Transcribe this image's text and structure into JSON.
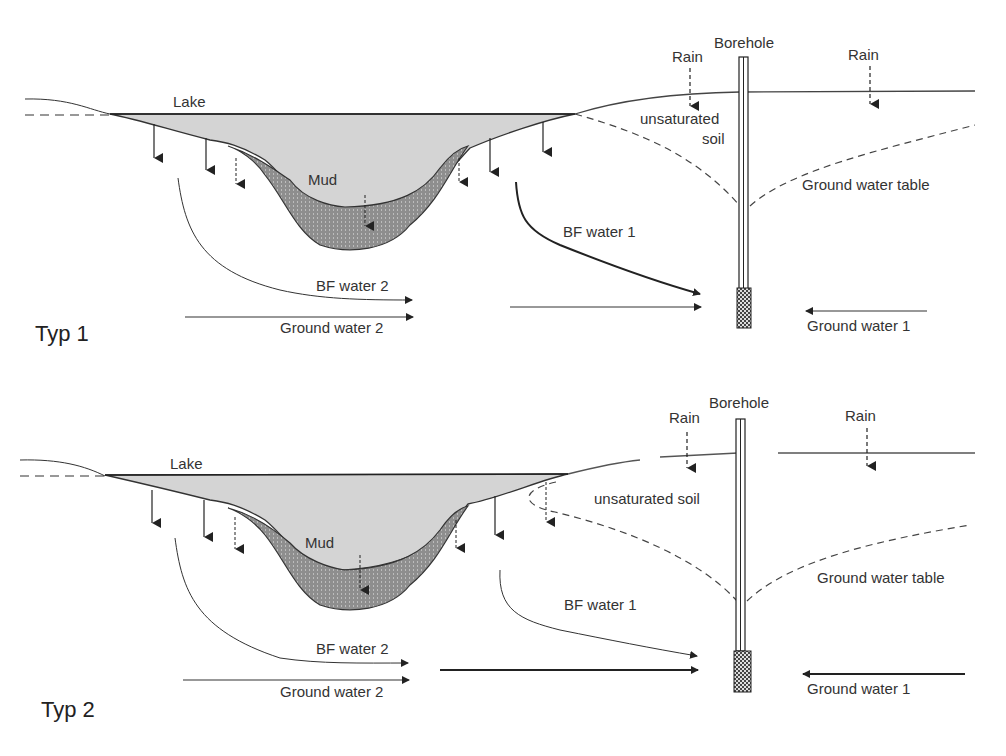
{
  "panels": [
    {
      "title": "Typ 1",
      "labels": {
        "lake": "Lake",
        "mud": "Mud",
        "borehole": "Borehole",
        "rain_left": "Rain",
        "rain_right": "Rain",
        "unsaturated_line1": "unsaturated",
        "unsaturated_line2": "soil",
        "ground_water_table": "Ground water table",
        "bf_water_1": "BF water 1",
        "bf_water_2": "BF water 2",
        "ground_water_1": "Ground water 1",
        "ground_water_2": "Ground water 2"
      }
    },
    {
      "title": "Typ 2",
      "labels": {
        "lake": "Lake",
        "mud": "Mud",
        "borehole": "Borehole",
        "rain_left": "Rain",
        "rain_right": "Rain",
        "unsaturated": "unsaturated soil",
        "ground_water_table": "Ground water table",
        "bf_water_1": "BF water 1",
        "bf_water_2": "BF water 2",
        "ground_water_1": "Ground water 1",
        "ground_water_2": "Ground water 2"
      }
    }
  ],
  "colors": {
    "lake_fill": "#d4d4d4",
    "mud_fill": "#9a9a9a",
    "line": "#333333",
    "screen_fill": "#777777"
  }
}
